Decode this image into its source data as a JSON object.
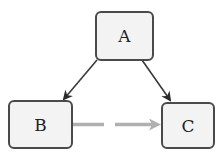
{
  "diagram": {
    "nodes": [
      {
        "id": "A",
        "label": "A"
      },
      {
        "id": "B",
        "label": "B"
      },
      {
        "id": "C",
        "label": "C"
      }
    ],
    "edges": [
      {
        "from": "A",
        "to": "B",
        "style": "solid",
        "color": "#3a3a3a"
      },
      {
        "from": "A",
        "to": "C",
        "style": "solid",
        "color": "#3a3a3a"
      },
      {
        "from": "B",
        "to": "C",
        "style": "dashed",
        "color": "#b0b0b0"
      }
    ],
    "colors": {
      "node_fill": "#f3f3f3",
      "node_border": "#4a4a4a",
      "solid_edge": "#3a3a3a",
      "dashed_edge": "#b0b0b0"
    }
  }
}
